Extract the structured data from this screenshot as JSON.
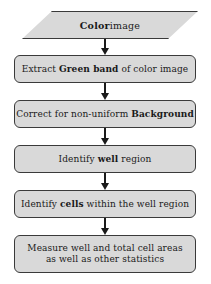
{
  "diagram": {
    "type": "flowchart",
    "orientation": "vertical",
    "colors": {
      "node_fill": "#d9d9d9",
      "node_border": "#3a3a3a",
      "text": "#1a1a1a",
      "arrow": "#1a1a1a",
      "background": "#ffffff"
    },
    "nodes": [
      {
        "id": "input",
        "shape": "parallelogram",
        "text": "Color image",
        "bold_words": [
          "Color"
        ],
        "line1_bold": "Color",
        "line1_rest": " image"
      },
      {
        "id": "step1",
        "shape": "rounded-rectangle",
        "text": "Extract Green band of color image",
        "bold_words": [
          "Green band"
        ],
        "prefix": "Extract ",
        "bold": "Green band",
        "suffix": " of color image"
      },
      {
        "id": "step2",
        "shape": "rounded-rectangle",
        "text": "Correct for non-uniform Background",
        "bold_words": [
          "Background"
        ],
        "prefix": "Correct for non-uniform ",
        "bold": "Background",
        "suffix": ""
      },
      {
        "id": "step3",
        "shape": "rounded-rectangle",
        "text": "Identify well region",
        "bold_words": [
          "well"
        ],
        "prefix": "Identify ",
        "bold": "well",
        "suffix": " region"
      },
      {
        "id": "step4",
        "shape": "rounded-rectangle",
        "text": "Identify cells within the well region",
        "bold_words": [
          "cells"
        ],
        "prefix": "Identify ",
        "bold": "cells",
        "suffix": " within the well region"
      },
      {
        "id": "step5",
        "shape": "rounded-rectangle",
        "text": "Measure well and total cell areas as well as other statistics",
        "bold_words": [],
        "line1": "Measure well and total cell areas",
        "line2": "as well as other statistics"
      }
    ],
    "edges": [
      {
        "id": "edge-1",
        "from": "input",
        "to": "step1",
        "marker": "arrow-down"
      },
      {
        "id": "edge-2",
        "from": "step1",
        "to": "step2",
        "marker": "arrow-down"
      },
      {
        "id": "edge-3",
        "from": "step2",
        "to": "step3",
        "marker": "arrow-down"
      },
      {
        "id": "edge-4",
        "from": "step3",
        "to": "step4",
        "marker": "arrow-down"
      },
      {
        "id": "edge-5",
        "from": "step4",
        "to": "step5",
        "marker": "arrow-down"
      }
    ]
  }
}
